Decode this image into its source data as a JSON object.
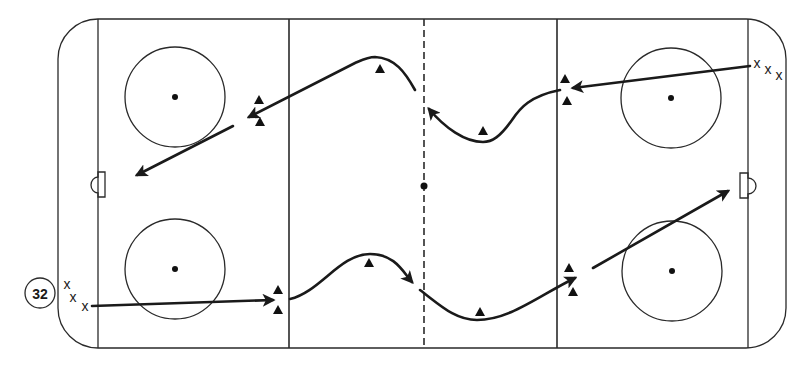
{
  "figure": {
    "number": "32",
    "badge": {
      "cx": 40,
      "cy": 293,
      "r": 15
    }
  },
  "colors": {
    "line": "#2a2a2a",
    "ink": "#1a1a1a",
    "background": "#ffffff"
  },
  "rink": {
    "outline": {
      "x": 58,
      "y": 19,
      "width": 728,
      "height": 329,
      "corner_radius": 40
    },
    "goal_lines_x": [
      98,
      748
    ],
    "blue_lines_x": [
      289,
      557
    ],
    "center_line_x": 424,
    "center_dot": {
      "cx": 424,
      "cy": 186,
      "r": 3.5
    },
    "faceoff_circles": [
      {
        "name": "top-left",
        "cx": 175,
        "cy": 97,
        "r": 50
      },
      {
        "name": "top-right",
        "cx": 671,
        "cy": 98,
        "r": 50
      },
      {
        "name": "bottom-left",
        "cx": 175,
        "cy": 269,
        "r": 50
      },
      {
        "name": "bottom-right",
        "cx": 672,
        "cy": 271,
        "r": 50
      }
    ],
    "goal_creases": [
      {
        "name": "left",
        "d": "M105,172 L98,172 L98,177 A7,8 0 0 0 98,193 L98,197 L105,197 Z"
      },
      {
        "name": "right",
        "d": "M740,173 L748,173 L748,178 A8,8 0 0 1 748,194 L748,198 L740,198 Z"
      }
    ]
  },
  "skaters": [
    {
      "group": "top-right",
      "label": "x",
      "x": 757,
      "y": 68
    },
    {
      "group": "top-right",
      "label": "x",
      "x": 768,
      "y": 74
    },
    {
      "group": "top-right",
      "label": "x",
      "x": 779,
      "y": 80
    },
    {
      "group": "bottom-left",
      "label": "x",
      "x": 67,
      "y": 289
    },
    {
      "group": "bottom-left",
      "label": "x",
      "x": 73,
      "y": 302
    },
    {
      "group": "bottom-left",
      "label": "x",
      "x": 85,
      "y": 311
    }
  ],
  "cones": [
    {
      "x": 259,
      "y": 100
    },
    {
      "x": 260,
      "y": 122
    },
    {
      "x": 380,
      "y": 69
    },
    {
      "x": 483,
      "y": 131
    },
    {
      "x": 565,
      "y": 79
    },
    {
      "x": 567,
      "y": 101
    },
    {
      "x": 278,
      "y": 290
    },
    {
      "x": 278,
      "y": 310
    },
    {
      "x": 369,
      "y": 263
    },
    {
      "x": 480,
      "y": 312
    },
    {
      "x": 569,
      "y": 268
    },
    {
      "x": 573,
      "y": 292
    }
  ],
  "paths": [
    {
      "name": "top-pass-to-blue-line",
      "d": "M750,66 L573,88",
      "arrow": true
    },
    {
      "name": "top-skate-through-neutral-right",
      "d": "M560,90 C530,96 520,108 512,120 C500,137 492,142 483,142 C465,142 445,128 429,109",
      "arrow": true
    },
    {
      "name": "top-skate-through-neutral-left",
      "d": "M415,90 C405,72 395,58 375,57 C368,57 362,60 355,63 L249,117",
      "arrow": true
    },
    {
      "name": "top-shot-to-left-net",
      "d": "M233,126 L137,175",
      "arrow": true
    },
    {
      "name": "bottom-pass-to-blue-line",
      "d": "M92,306 L273,300",
      "arrow": true
    },
    {
      "name": "bottom-skate-through-neutral-left",
      "d": "M290,299 C320,292 340,254 370,254 C395,254 403,272 412,282",
      "arrow": true
    },
    {
      "name": "bottom-skate-through-neutral-right",
      "d": "M420,290 C440,305 455,320 477,320 C510,320 540,295 575,278",
      "arrow": true
    },
    {
      "name": "bottom-shot-to-right-net",
      "d": "M593,268 L728,191",
      "arrow": true
    }
  ]
}
